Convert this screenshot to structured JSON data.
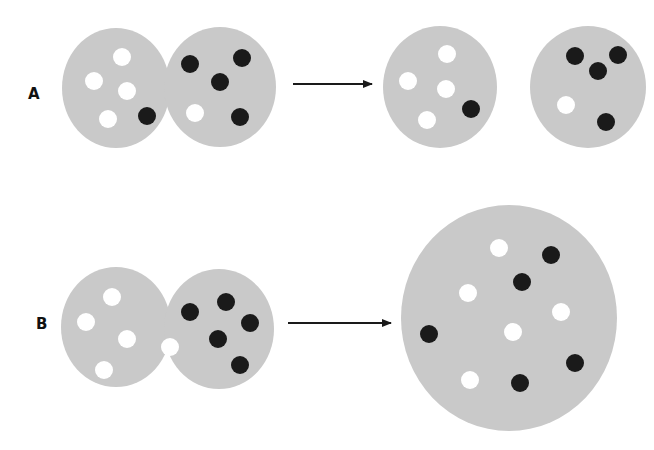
{
  "colors": {
    "background": "#ffffff",
    "cell": "#c9c9c9",
    "white_particle": "#ffffff",
    "black_particle": "#1a1a1a",
    "arrow": "#1a1a1a",
    "label": "#111111"
  },
  "rows": [
    {
      "label": "A",
      "label_pos": [
        28,
        100
      ],
      "description": "Two fused cells separate into two cells",
      "before": {
        "cells": [
          {
            "cx": 116,
            "cy": 88,
            "rx": 54,
            "ry": 60
          },
          {
            "cx": 220,
            "cy": 87,
            "rx": 56,
            "ry": 60
          }
        ],
        "white_particles": [
          [
            122,
            57
          ],
          [
            94,
            81
          ],
          [
            127,
            91
          ],
          [
            108,
            119
          ],
          [
            195,
            113
          ]
        ],
        "black_particles": [
          [
            147,
            116
          ],
          [
            190,
            64
          ],
          [
            242,
            58
          ],
          [
            220,
            82
          ],
          [
            240,
            117
          ]
        ]
      },
      "arrow": {
        "x1": 293,
        "y1": 84,
        "x2": 374,
        "y2": 84
      },
      "after": {
        "cells": [
          {
            "cx": 440,
            "cy": 87,
            "rx": 57,
            "ry": 61
          },
          {
            "cx": 588,
            "cy": 87,
            "rx": 58,
            "ry": 61
          }
        ],
        "white_particles": [
          [
            447,
            54
          ],
          [
            408,
            81
          ],
          [
            446,
            89
          ],
          [
            427,
            120
          ],
          [
            566,
            105
          ]
        ],
        "black_particles": [
          [
            471,
            109
          ],
          [
            575,
            56
          ],
          [
            618,
            55
          ],
          [
            598,
            71
          ],
          [
            606,
            122
          ]
        ]
      }
    },
    {
      "label": "B",
      "label_pos": [
        36,
        330
      ],
      "description": "Two fused cells merge into one large cell",
      "before": {
        "cells": [
          {
            "cx": 116,
            "cy": 327,
            "rx": 55,
            "ry": 60
          },
          {
            "cx": 219,
            "cy": 329,
            "rx": 55,
            "ry": 60
          }
        ],
        "white_particles": [
          [
            112,
            297
          ],
          [
            86,
            322
          ],
          [
            127,
            339
          ],
          [
            104,
            370
          ],
          [
            170,
            347
          ]
        ],
        "black_particles": [
          [
            190,
            312
          ],
          [
            226,
            302
          ],
          [
            250,
            323
          ],
          [
            218,
            339
          ],
          [
            240,
            365
          ]
        ]
      },
      "arrow": {
        "x1": 288,
        "y1": 323,
        "x2": 393,
        "y2": 323
      },
      "after": {
        "cells": [
          {
            "cx": 509,
            "cy": 318,
            "rx": 108,
            "ry": 113
          }
        ],
        "white_particles": [
          [
            499,
            248
          ],
          [
            468,
            293
          ],
          [
            561,
            312
          ],
          [
            513,
            332
          ],
          [
            470,
            380
          ]
        ],
        "black_particles": [
          [
            551,
            255
          ],
          [
            522,
            282
          ],
          [
            429,
            334
          ],
          [
            575,
            363
          ],
          [
            520,
            383
          ]
        ]
      }
    }
  ],
  "particle_radius": 9
}
